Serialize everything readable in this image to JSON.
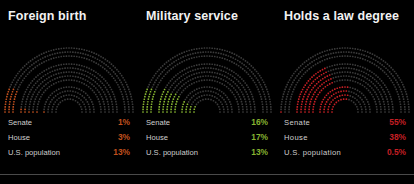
{
  "background": "#000000",
  "divider_color": "#4a4a4a",
  "title_color": "#f2f2f2",
  "label_color": "#cfcfcf",
  "panels": [
    {
      "title": "Foreign birth",
      "accent": "#c0501e",
      "base": "#3a3a3a",
      "label_spacing": "normal",
      "rows": [
        {
          "label": "Senate",
          "value": "1%"
        },
        {
          "label": "House",
          "value": "3%"
        },
        {
          "label": "U.S. population",
          "value": "13%"
        }
      ]
    },
    {
      "title": "Military service",
      "accent": "#86b431",
      "base": "#3a3a3a",
      "label_spacing": "normal",
      "rows": [
        {
          "label": "Senate",
          "value": "16%"
        },
        {
          "label": "House",
          "value": "17%"
        },
        {
          "label": "U.S. population",
          "value": "13%"
        }
      ]
    },
    {
      "title": "Holds a law degree",
      "accent": "#c41f24",
      "base": "#3a3a3a",
      "label_spacing": "wide",
      "rows": [
        {
          "label": "Senate",
          "value": "55%"
        },
        {
          "label": "House",
          "value": "38%"
        },
        {
          "label": "U.S. population",
          "value": "0.5%"
        }
      ]
    }
  ],
  "chart_data": {
    "type": "pie",
    "subtype": "nested-semicircular-dot-hemicycle",
    "title": "",
    "legend_position": "below-chart",
    "grid": false,
    "bands": [
      "U.S. population",
      "House",
      "Senate"
    ],
    "band_order_outer_to_inner": [
      "U.S. population",
      "House",
      "Senate"
    ],
    "units": "percent",
    "series": [
      {
        "name": "Foreign birth",
        "categories": [
          "Senate",
          "House",
          "U.S. population"
        ],
        "values": [
          1,
          3,
          13
        ],
        "labels": [
          "1%",
          "3%",
          "13%"
        ],
        "color": "#c0501e"
      },
      {
        "name": "Military service",
        "categories": [
          "Senate",
          "House",
          "U.S. population"
        ],
        "values": [
          16,
          17,
          13
        ],
        "labels": [
          "16%",
          "17%",
          "13%"
        ],
        "color": "#86b431"
      },
      {
        "name": "Holds a law degree",
        "categories": [
          "Senate",
          "House",
          "U.S. population"
        ],
        "values": [
          55,
          38,
          0.5
        ],
        "labels": [
          "55%",
          "38%",
          "0.5%"
        ],
        "color": "#c41f24"
      }
    ],
    "ylim": [
      0,
      100
    ]
  }
}
